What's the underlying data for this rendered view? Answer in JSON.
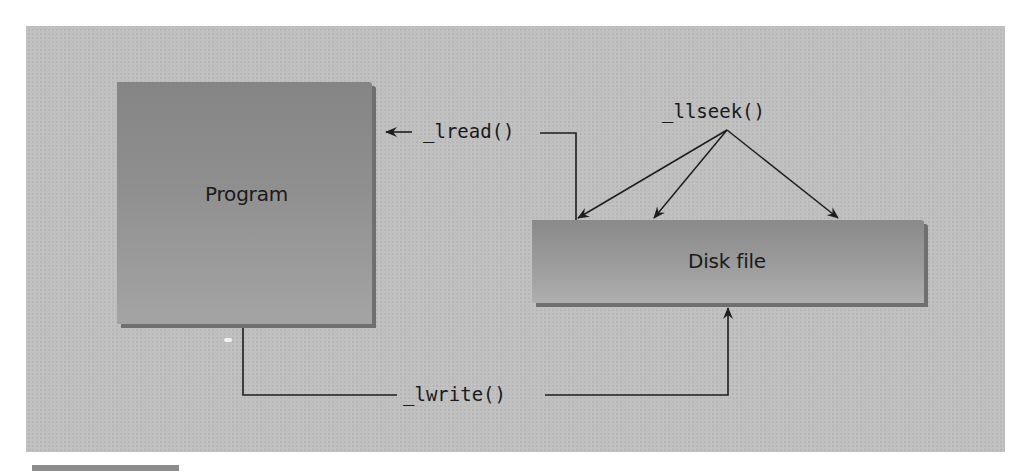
{
  "diagram": {
    "background_color": "#c0c0c0",
    "nodes": [
      {
        "id": "program",
        "label": "Program"
      },
      {
        "id": "disk_file",
        "label": "Disk file"
      }
    ],
    "edges": [
      {
        "id": "lread",
        "label": "_lread()",
        "from": "disk_file",
        "to": "program"
      },
      {
        "id": "lwrite",
        "label": "_lwrite()",
        "from": "program",
        "to": "disk_file"
      },
      {
        "id": "llseek",
        "label": "_llseek()",
        "targets": [
          "disk_file_start",
          "disk_file_middle",
          "disk_file_end"
        ]
      }
    ],
    "stroke_color": "#1e1e1e"
  }
}
